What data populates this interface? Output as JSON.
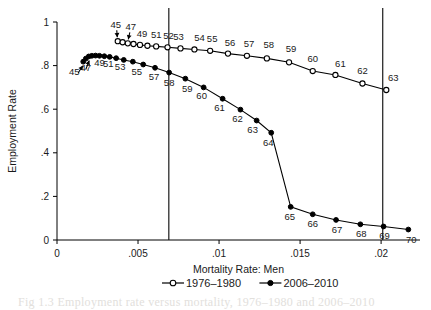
{
  "chart_data": {
    "type": "line",
    "title": "",
    "xlabel": "Mortality Rate: Men",
    "ylabel": "Employment Rate",
    "xlim": [
      0,
      0.0224
    ],
    "ylim": [
      0,
      1
    ],
    "xticks": [
      0,
      0.005,
      0.01,
      0.015,
      0.02
    ],
    "xtick_labels": [
      "0",
      ".005",
      ".01",
      ".015",
      ".02"
    ],
    "yticks": [
      0,
      0.2,
      0.4,
      0.6,
      0.8,
      1
    ],
    "ytick_labels": [
      "0",
      ".2",
      ".4",
      ".6",
      ".8",
      "1"
    ],
    "grid": false,
    "legend_position": "below-axis",
    "reference_lines": [
      {
        "orientation": "vertical",
        "x": 0.0069
      },
      {
        "orientation": "vertical",
        "x": 0.0201
      }
    ],
    "series": [
      {
        "name": "1976-1980",
        "legend_label": "1976–1980",
        "marker": "open-circle",
        "point_labels_are_ages": true,
        "points": [
          {
            "age": "45",
            "x": 0.00375,
            "y": 0.912
          },
          {
            "age": "46",
            "x": 0.00405,
            "y": 0.907
          },
          {
            "age": "47",
            "x": 0.00437,
            "y": 0.902
          },
          {
            "age": "48",
            "x": 0.00472,
            "y": 0.899
          },
          {
            "age": "49",
            "x": 0.00512,
            "y": 0.895
          },
          {
            "age": "50",
            "x": 0.00558,
            "y": 0.891
          },
          {
            "age": "51",
            "x": 0.00612,
            "y": 0.888
          },
          {
            "age": "52",
            "x": 0.00682,
            "y": 0.884
          },
          {
            "age": "53",
            "x": 0.00762,
            "y": 0.879
          },
          {
            "age": "54",
            "x": 0.00848,
            "y": 0.874
          },
          {
            "age": "55",
            "x": 0.00945,
            "y": 0.868
          },
          {
            "age": "56",
            "x": 0.01055,
            "y": 0.855
          },
          {
            "age": "57",
            "x": 0.01172,
            "y": 0.845
          },
          {
            "age": "58",
            "x": 0.01295,
            "y": 0.833
          },
          {
            "age": "59",
            "x": 0.01432,
            "y": 0.815
          },
          {
            "age": "60",
            "x": 0.01578,
            "y": 0.775
          },
          {
            "age": "61",
            "x": 0.01718,
            "y": 0.757
          },
          {
            "age": "62",
            "x": 0.01885,
            "y": 0.718
          },
          {
            "age": "63",
            "x": 0.02032,
            "y": 0.688
          }
        ]
      },
      {
        "name": "2006-2010",
        "legend_label": "2006–2010",
        "marker": "filled-circle",
        "point_labels_are_ages": true,
        "points": [
          {
            "age": "45",
            "x": 0.00162,
            "y": 0.818
          },
          {
            "age": "46",
            "x": 0.00178,
            "y": 0.832
          },
          {
            "age": "47",
            "x": 0.00196,
            "y": 0.842
          },
          {
            "age": "48",
            "x": 0.00215,
            "y": 0.845
          },
          {
            "age": "49",
            "x": 0.00238,
            "y": 0.846
          },
          {
            "age": "50",
            "x": 0.00262,
            "y": 0.845
          },
          {
            "age": "51",
            "x": 0.00292,
            "y": 0.843
          },
          {
            "age": "52",
            "x": 0.00325,
            "y": 0.84
          },
          {
            "age": "53",
            "x": 0.00365,
            "y": 0.834
          },
          {
            "age": "54",
            "x": 0.00412,
            "y": 0.826
          },
          {
            "age": "55",
            "x": 0.00468,
            "y": 0.818
          },
          {
            "age": "56",
            "x": 0.00532,
            "y": 0.805
          },
          {
            "age": "57",
            "x": 0.00605,
            "y": 0.79
          },
          {
            "age": "58",
            "x": 0.00692,
            "y": 0.768
          },
          {
            "age": "59",
            "x": 0.00792,
            "y": 0.74
          },
          {
            "age": "60",
            "x": 0.00905,
            "y": 0.7
          },
          {
            "age": "61",
            "x": 0.01022,
            "y": 0.648
          },
          {
            "age": "62",
            "x": 0.01132,
            "y": 0.598
          },
          {
            "age": "63",
            "x": 0.01232,
            "y": 0.548
          },
          {
            "age": "64",
            "x": 0.01322,
            "y": 0.492
          },
          {
            "age": "65",
            "x": 0.01442,
            "y": 0.152
          },
          {
            "age": "66",
            "x": 0.01578,
            "y": 0.118
          },
          {
            "age": "67",
            "x": 0.01722,
            "y": 0.092
          },
          {
            "age": "68",
            "x": 0.01872,
            "y": 0.072
          },
          {
            "age": "69",
            "x": 0.02015,
            "y": 0.062
          },
          {
            "age": "70",
            "x": 0.02168,
            "y": 0.048
          }
        ]
      }
    ],
    "annotations": [
      {
        "text": "45",
        "series": "1976-1980",
        "points_to_age": "45",
        "style": "arrow"
      },
      {
        "text": "47",
        "series": "1976-1980",
        "points_to_age": "47",
        "style": "arrow"
      },
      {
        "text": "49",
        "series": "1976-1980",
        "points_to_age": "49",
        "style": "plain"
      },
      {
        "text": "51",
        "series": "1976-1980",
        "points_to_age": "51",
        "style": "plain"
      },
      {
        "text": "45",
        "series": "2006-2010",
        "points_to_age": "45",
        "style": "arrow"
      },
      {
        "text": "47",
        "series": "2006-2010",
        "points_to_age": "47",
        "style": "arrow"
      }
    ]
  },
  "legend": {
    "entries": [
      {
        "label": "1976–1980",
        "marker": "open-circle"
      },
      {
        "label": "2006–2010",
        "marker": "filled-circle"
      }
    ]
  },
  "caption": {
    "partial_text": "Fig 1.3   Employment rate versus mortality, 1976–1980 and 2006–2010"
  }
}
